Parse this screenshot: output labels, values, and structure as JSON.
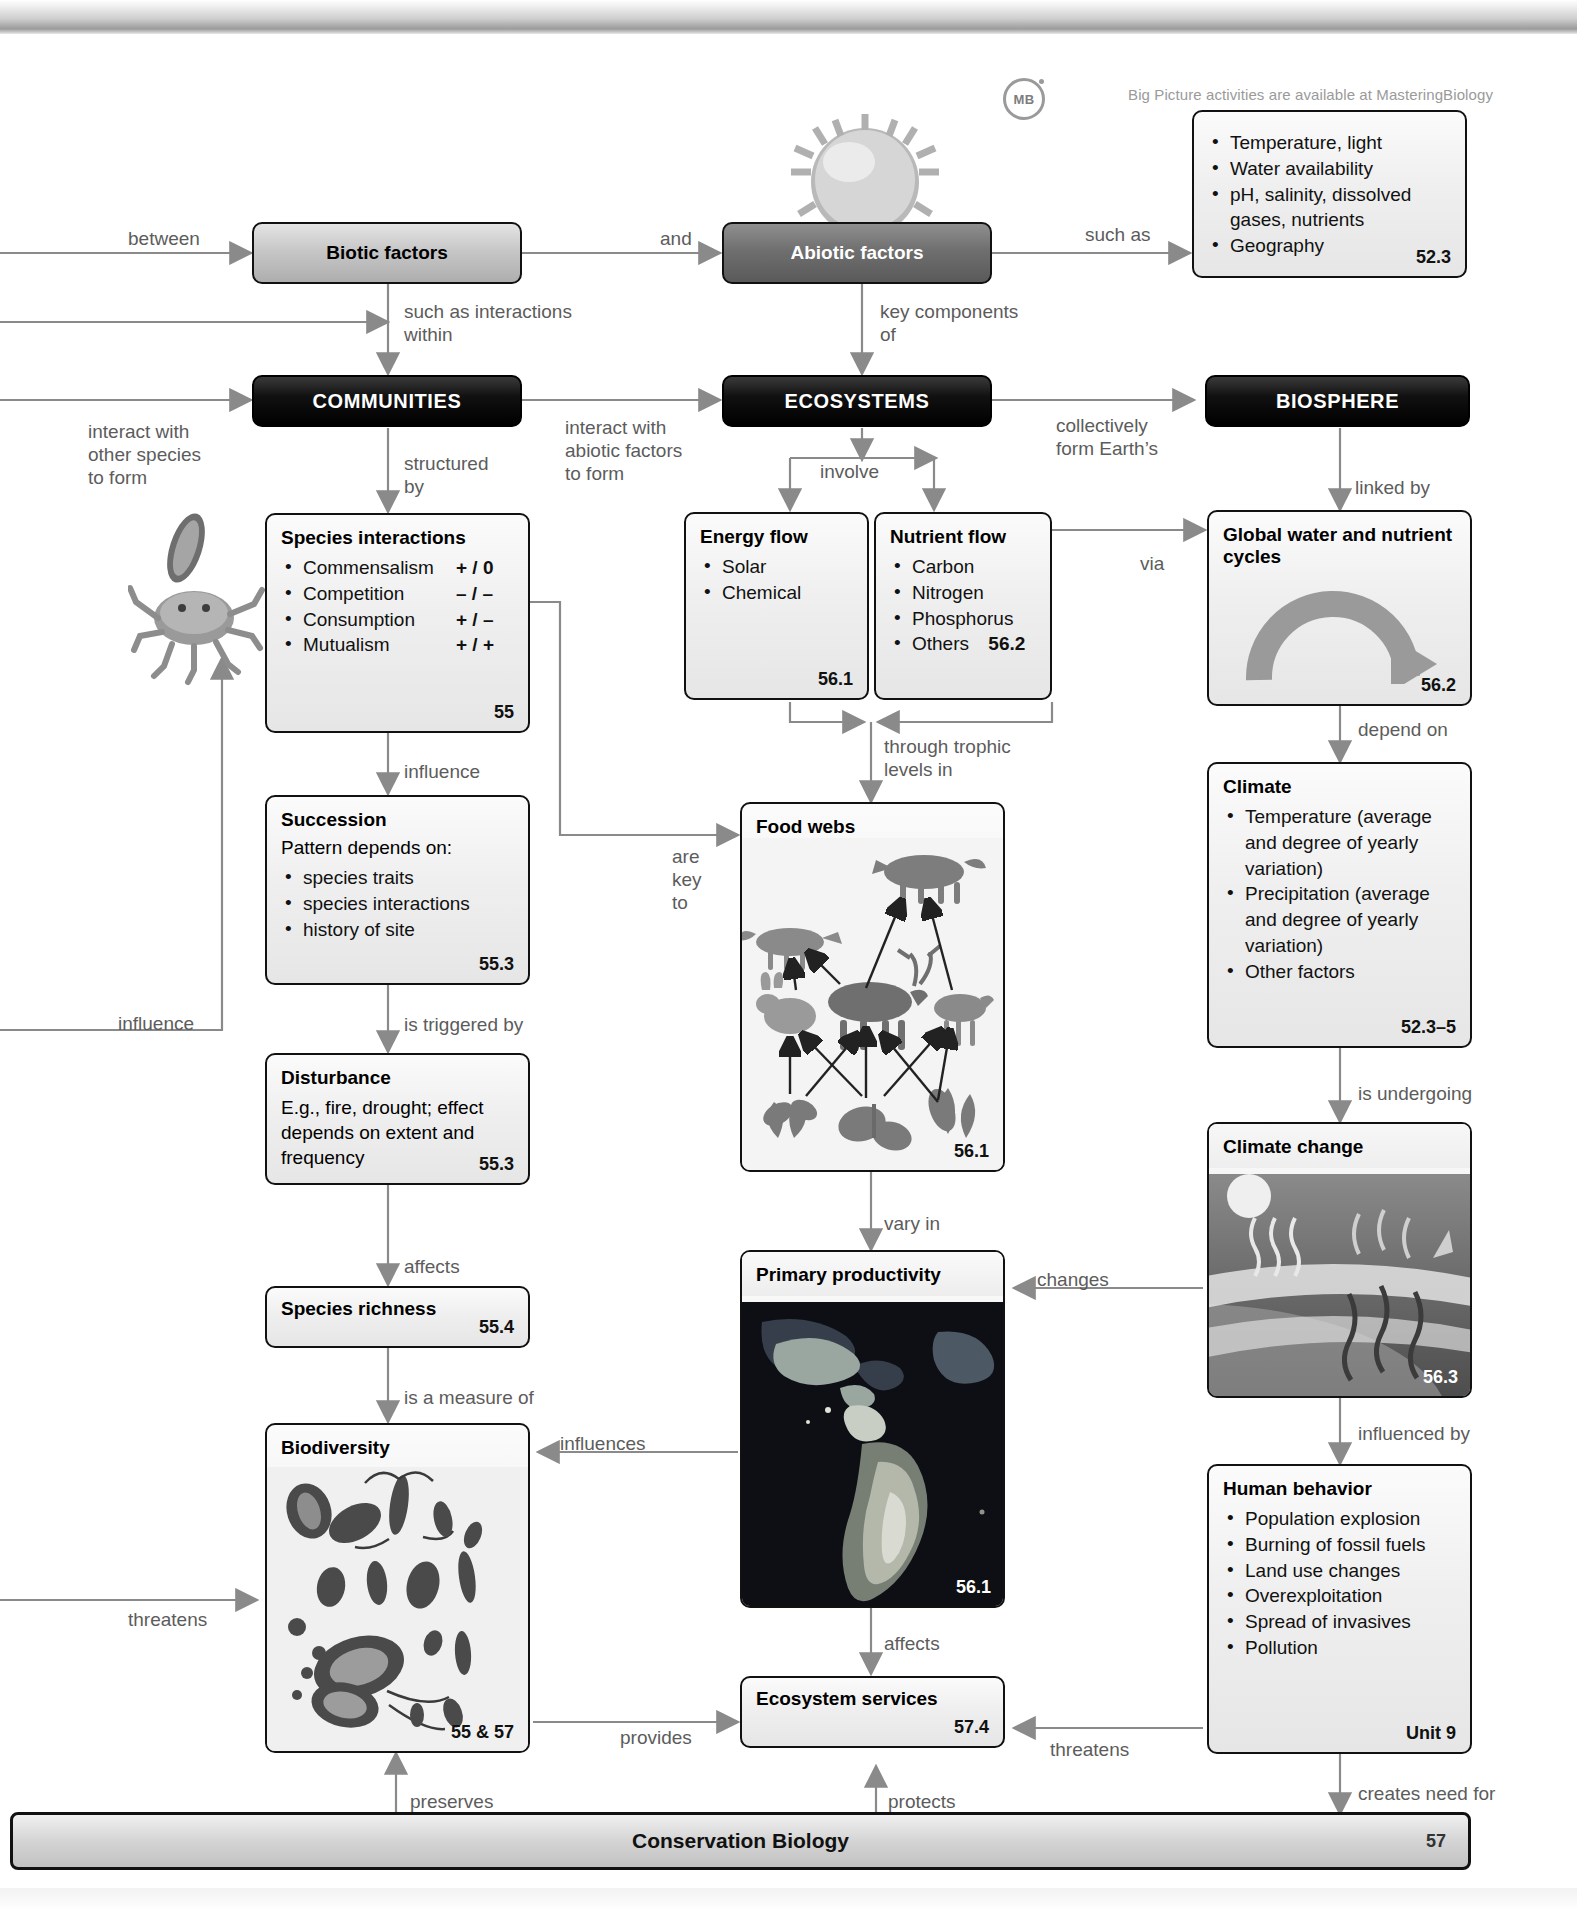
{
  "page": {
    "masteringbiology_note": "Big Picture activities are available at MasteringBiology",
    "mb_badge": "MB",
    "banner_title": "Conservation Biology",
    "banner_page": "57"
  },
  "nodes": {
    "biotic_factors": {
      "title": "Biotic factors"
    },
    "abiotic_factors": {
      "title": "Abiotic factors"
    },
    "abiotic_examples": {
      "items": [
        "Temperature, light",
        "Water availability",
        "pH, salinity, dissolved gases, nutrients",
        "Geography"
      ],
      "ref": "52.3"
    },
    "communities": {
      "title": "COMMUNITIES"
    },
    "ecosystems": {
      "title": "ECOSYSTEMS"
    },
    "biosphere": {
      "title": "BIOSPHERE"
    },
    "species_interactions": {
      "title": "Species interactions",
      "items": [
        {
          "name": "Commensalism",
          "effect": "+ / 0"
        },
        {
          "name": "Competition",
          "effect": "– / –"
        },
        {
          "name": "Consumption",
          "effect": "+ / –"
        },
        {
          "name": "Mutualism",
          "effect": "+ / +"
        }
      ],
      "ref": "55"
    },
    "succession": {
      "title": "Succession",
      "lead": "Pattern depends on:",
      "items": [
        "species traits",
        "species interactions",
        "history of site"
      ],
      "ref": "55.3"
    },
    "disturbance": {
      "title": "Disturbance",
      "body": "E.g., fire, drought; effect depends on extent and frequency",
      "ref": "55.3"
    },
    "species_richness": {
      "title": "Species richness",
      "ref": "55.4"
    },
    "biodiversity": {
      "title": "Biodiversity",
      "ref": "55 & 57"
    },
    "energy_flow": {
      "title": "Energy flow",
      "items": [
        "Solar",
        "Chemical"
      ],
      "ref": "56.1"
    },
    "nutrient_flow": {
      "title": "Nutrient flow",
      "items": [
        "Carbon",
        "Nitrogen",
        "Phosphorus",
        "Others"
      ],
      "ref": "56.2"
    },
    "food_webs": {
      "title": "Food webs",
      "ref": "56.1"
    },
    "primary_productivity": {
      "title": "Primary productivity",
      "ref": "56.1"
    },
    "ecosystem_services": {
      "title": "Ecosystem services",
      "ref": "57.4"
    },
    "global_cycles": {
      "title": "Global water and nutrient cycles",
      "ref": "56.2"
    },
    "climate": {
      "title": "Climate",
      "items": [
        "Temperature (average and degree of yearly variation)",
        "Precipitation (average and degree of yearly variation)",
        "Other factors"
      ],
      "ref": "52.3–5"
    },
    "climate_change": {
      "title": "Climate change",
      "ref": "56.3"
    },
    "human_behavior": {
      "title": "Human behavior",
      "items": [
        "Population explosion",
        "Burning of fossil fuels",
        "Land use changes",
        "Overexploitation",
        "Spread of invasives",
        "Pollution"
      ],
      "ref": "Unit 9"
    }
  },
  "links": {
    "between": "between",
    "and": "and",
    "such_as": "such as",
    "such_as_interactions_within": "such as interactions\nwithin",
    "key_components_of": "key components\nof",
    "interact_with_other_species_to_form": "interact with\nother species\nto form",
    "interact_with_abiotic_factors_to_form": "interact with\nabiotic factors\nto form",
    "collectively_form_earths": "collectively\nform Earth’s",
    "structured_by": "structured\nby",
    "involve": "involve",
    "linked_by": "linked by",
    "via": "via",
    "influence_down": "influence",
    "influence_left": "influence",
    "is_triggered_by": "is triggered by",
    "affects_left": "affects",
    "is_a_measure_of": "is a measure of",
    "threatens_left": "threatens",
    "are_key_to": "are\nkey\nto",
    "through_trophic_levels_in": "through trophic\nlevels in",
    "vary_in": "vary in",
    "affects_bottom": "affects",
    "influences": "influences",
    "provides": "provides",
    "preserves": "preserves",
    "protects": "protects",
    "depend_on": "depend on",
    "is_undergoing": "is undergoing",
    "changes": "changes",
    "influenced_by": "influenced by",
    "threatens_right": "threatens",
    "creates_need_for": "creates need for"
  },
  "colors": {
    "line": "#8a8a8a",
    "label_text": "#5c5c5c",
    "box_border": "#111111",
    "dark_box": "#000000"
  }
}
